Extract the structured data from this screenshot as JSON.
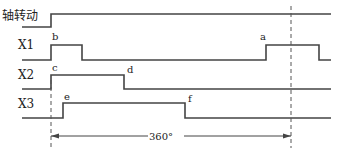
{
  "signals": [
    {
      "id": "shaft",
      "label": "轴转动",
      "label_x": 2,
      "label_y": 20,
      "points": "22,27 51,27 51,14 331,14"
    },
    {
      "id": "x1",
      "label": "X1",
      "label_x": 18,
      "label_y": 49,
      "points": "22,60 51,60 51,45 82,45 82,60 266,60 266,45 319,45 319,60 331,60"
    },
    {
      "id": "x2",
      "label": "X2",
      "label_x": 18,
      "label_y": 79,
      "points": "22,89 51,89 51,75 124,75 124,89 331,89"
    },
    {
      "id": "x3",
      "label": "X3",
      "label_x": 18,
      "label_y": 108,
      "points": "22,118 63,118 63,103 185,103 185,118 331,118"
    }
  ],
  "events": [
    {
      "label": "b",
      "x": 52,
      "y": 40
    },
    {
      "label": "a",
      "x": 260,
      "y": 40
    },
    {
      "label": "c",
      "x": 52,
      "y": 71
    },
    {
      "label": "d",
      "x": 127,
      "y": 73
    },
    {
      "label": "e",
      "x": 64,
      "y": 100
    },
    {
      "label": "f",
      "x": 188,
      "y": 102
    }
  ],
  "reference_lines": [
    {
      "id": "start",
      "x": 51,
      "y1": 80,
      "y2": 148
    },
    {
      "id": "end",
      "x": 291,
      "y1": 6,
      "y2": 148
    }
  ],
  "dimension": {
    "label": "360°",
    "y": 136,
    "x_start": 51,
    "x_end": 291,
    "label_x": 161,
    "gap_left": 148,
    "gap_right": 184
  }
}
